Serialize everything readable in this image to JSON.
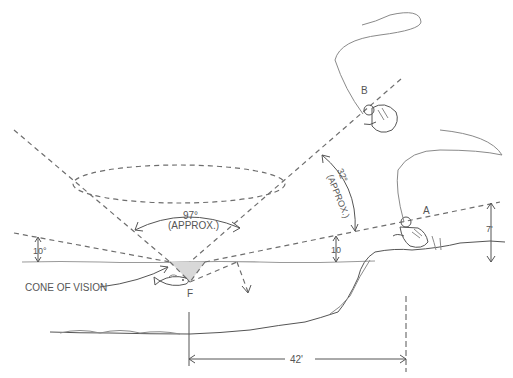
{
  "diagram": {
    "labels": {
      "fisherman_a": "A",
      "fisherman_b": "B",
      "fish": "F",
      "cone_of_vision": "CONE OF VISION",
      "cone_angle_value": "97°",
      "cone_angle_note": "(APPROX.)",
      "b_angle_value": "32°",
      "b_angle_note": "(APPROX.)",
      "left_elevation_angle": "10°",
      "right_elevation_angle": "10",
      "bank_height": "7'",
      "horizontal_distance": "42'"
    },
    "colors": {
      "line": "#6e6e6e",
      "pencil": "#8a8a8a",
      "text": "#555555"
    }
  }
}
